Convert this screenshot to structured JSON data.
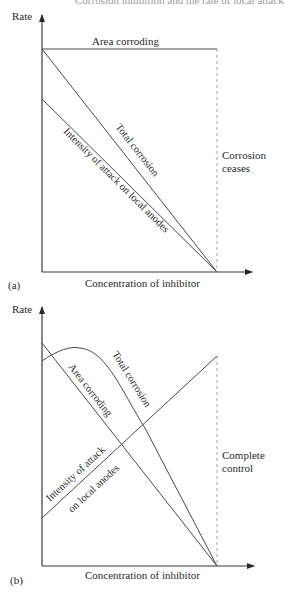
{
  "header_fragment": "Corrosion inhibition and the rate of local attack",
  "figure_a": {
    "panel_label": "(a)",
    "y_axis_label": "Rate",
    "x_axis_label": "Concentration of inhibitor",
    "curves": {
      "area_corroding": "Area corroding",
      "total_corrosion": "Total corrosion",
      "intensity": "Intensity of attack on local anodes"
    },
    "annotation_line1": "Corrosion",
    "annotation_line2": "ceases"
  },
  "figure_b": {
    "panel_label": "(b)",
    "y_axis_label": "Rate",
    "x_axis_label": "Concentration of inhibitor",
    "curves": {
      "area_corroding": "Area corroding",
      "total_corrosion": "Total corrosion",
      "intensity_line1": "Intensity of attack",
      "intensity_line2": "on local anodes"
    },
    "annotation_line1": "Complete",
    "annotation_line2": "control"
  },
  "colors": {
    "line": "#4a4a4a",
    "axis": "#3a3a3a",
    "dashed": "#8a8a8a",
    "text": "#2a2a2a"
  }
}
